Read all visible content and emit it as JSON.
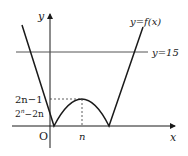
{
  "diagram": {
    "function_label": "y=f(x)",
    "horizontal_line_label": "y=15",
    "axis_x_label": "x",
    "axis_y_label": "y",
    "origin_label": "O",
    "peak_x_label": "n",
    "peak_y_label": "2n−1",
    "intercept_label_base": "2",
    "intercept_label_exp": "n",
    "intercept_label_rest": "−2n",
    "colors": {
      "curve": "#1a1a1a",
      "line_y15": "#555555",
      "axis": "#1a1a1a",
      "dashed": "#333333",
      "label_gray": "#555555"
    }
  }
}
